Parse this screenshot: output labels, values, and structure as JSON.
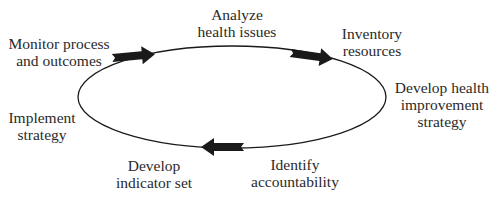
{
  "diagram": {
    "type": "cycle",
    "stroke_color": "#1a1a1a",
    "text_color": "#2a2a2a",
    "steps": [
      {
        "id": "analyze",
        "lines": [
          "Analyze",
          "health issues"
        ]
      },
      {
        "id": "inventory",
        "lines": [
          "Inventory",
          "resources"
        ]
      },
      {
        "id": "develop-strategy",
        "lines": [
          "Develop health",
          "improvement",
          "strategy"
        ]
      },
      {
        "id": "identify",
        "lines": [
          "Identify",
          "accountability"
        ]
      },
      {
        "id": "indicator",
        "lines": [
          "Develop",
          "indicator set"
        ]
      },
      {
        "id": "implement",
        "lines": [
          "Implement",
          "strategy"
        ]
      },
      {
        "id": "monitor",
        "lines": [
          "Monitor process",
          "and outcomes"
        ]
      }
    ],
    "arrows": [
      {
        "position": "top-left",
        "direction": "clockwise"
      },
      {
        "position": "top-right",
        "direction": "clockwise"
      },
      {
        "position": "bottom",
        "direction": "clockwise"
      }
    ]
  }
}
